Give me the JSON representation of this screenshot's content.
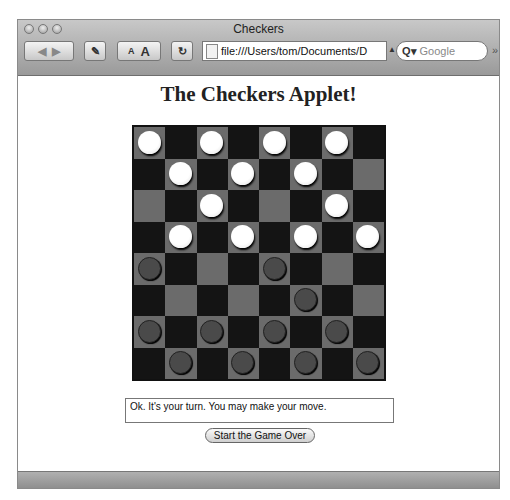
{
  "window": {
    "title": "Checkers"
  },
  "toolbar": {
    "back_forward_icon": "back-forward-arrows",
    "edit_icon": "pencil-box",
    "text_small": "A",
    "text_large": "A",
    "reload_icon": "C",
    "url": "file:///Users/tom/Documents/D",
    "search_placeholder": "Google",
    "search_icon": "Q▾",
    "overflow": "»"
  },
  "page": {
    "heading": "The Checkers Applet!",
    "message": "Ok. It's your turn. You may make your move.",
    "restart_label": "Start the Game Over"
  },
  "board": {
    "rows": [
      [
        "W",
        "",
        "W",
        "",
        "W",
        "",
        "W",
        ""
      ],
      [
        "",
        "W",
        "",
        "W",
        "",
        "W",
        "",
        ""
      ],
      [
        "",
        "",
        "W",
        "",
        "",
        "",
        "W",
        ""
      ],
      [
        "",
        "W",
        "",
        "W",
        "",
        "W",
        "",
        "W"
      ],
      [
        "B",
        "",
        "",
        "",
        "B",
        "",
        "",
        ""
      ],
      [
        "",
        "",
        "",
        "",
        "",
        "B",
        "",
        ""
      ],
      [
        "B",
        "",
        "B",
        "",
        "B",
        "",
        "B",
        ""
      ],
      [
        "",
        "B",
        "",
        "B",
        "",
        "B",
        "",
        "B"
      ]
    ],
    "colors": {
      "light_square": "#6b6b6b",
      "dark_square": "#141414",
      "white_piece": "#ffffff",
      "black_piece": "#4a4a4a"
    }
  }
}
